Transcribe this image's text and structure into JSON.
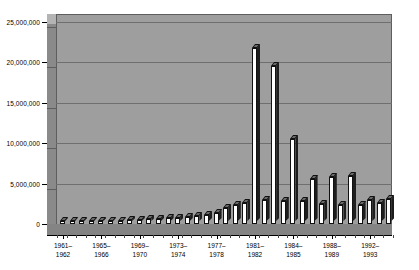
{
  "chart_data": {
    "type": "bar",
    "title": "",
    "subtitle": "",
    "xlabel": "",
    "ylabel": "",
    "ylim": [
      0,
      25000000
    ],
    "grid": true,
    "legend": null,
    "style": "3d-column",
    "y_ticks": [
      {
        "value": 25000000,
        "label": "25,000,000"
      },
      {
        "value": 20000000,
        "label": "20,000,000"
      },
      {
        "value": 15000000,
        "label": "15,000,000"
      },
      {
        "value": 10000000,
        "label": "10,000,000"
      },
      {
        "value": 5000000,
        "label": "5,000,000"
      },
      {
        "value": 0,
        "label": "0"
      }
    ],
    "x_tick_labels": [
      "1961–1962",
      "1965–1966",
      "1969–1970",
      "1973–1974",
      "1977–1978",
      "1981–1982",
      "1984–1985",
      "1988–1989",
      "1992–1993"
    ],
    "x_tick_bar_index": [
      0,
      4,
      8,
      12,
      16,
      20,
      24,
      28,
      32
    ],
    "categories": [
      "1961",
      "1962",
      "1963",
      "1964",
      "1965",
      "1966",
      "1967",
      "1968",
      "1969",
      "1970",
      "1971",
      "1972",
      "1973",
      "1974",
      "1975",
      "1976",
      "1977",
      "1978",
      "1979",
      "1980",
      "1981",
      "1982",
      "1983",
      "1984",
      "1985",
      "1986",
      "1987",
      "1988",
      "1989",
      "1990",
      "1991",
      "1992",
      "1993",
      "1994",
      "1995"
    ],
    "values": [
      180000,
      250000,
      300000,
      320000,
      350000,
      400000,
      420000,
      450000,
      500000,
      560000,
      620000,
      700000,
      780000,
      900000,
      1000000,
      1150000,
      1400000,
      2000000,
      2300000,
      2600000,
      21800000,
      3000000,
      19500000,
      2900000,
      10500000,
      2800000,
      5600000,
      2500000,
      5800000,
      2400000,
      5900000,
      2300000,
      3000000,
      2600000,
      3100000
    ],
    "colors": {
      "plot_background": "#9e9e9e",
      "bar_face": "#ffffff",
      "bar_side": "#1d1d1d",
      "bar_top": "#6b6b6b",
      "gridline": "#6f6f6f",
      "axis": "#000000",
      "page_background": "#ffffff"
    }
  }
}
